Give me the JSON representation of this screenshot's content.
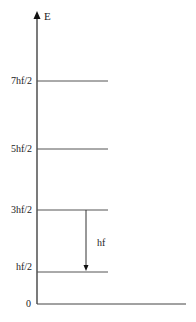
{
  "diagram": {
    "axis_label": "E",
    "origin_label": "0",
    "levels": [
      {
        "label": "7hf/2",
        "y": 81
      },
      {
        "label": "5hf/2",
        "y": 149
      },
      {
        "label": "3hf/2",
        "y": 210
      },
      {
        "label": "hf/2",
        "y": 272
      }
    ],
    "transition": {
      "label": "hf",
      "from": "3hf/2",
      "to": "hf/2"
    },
    "colors": {
      "axis": "#222222",
      "level": "#555555",
      "text": "#222222"
    }
  }
}
